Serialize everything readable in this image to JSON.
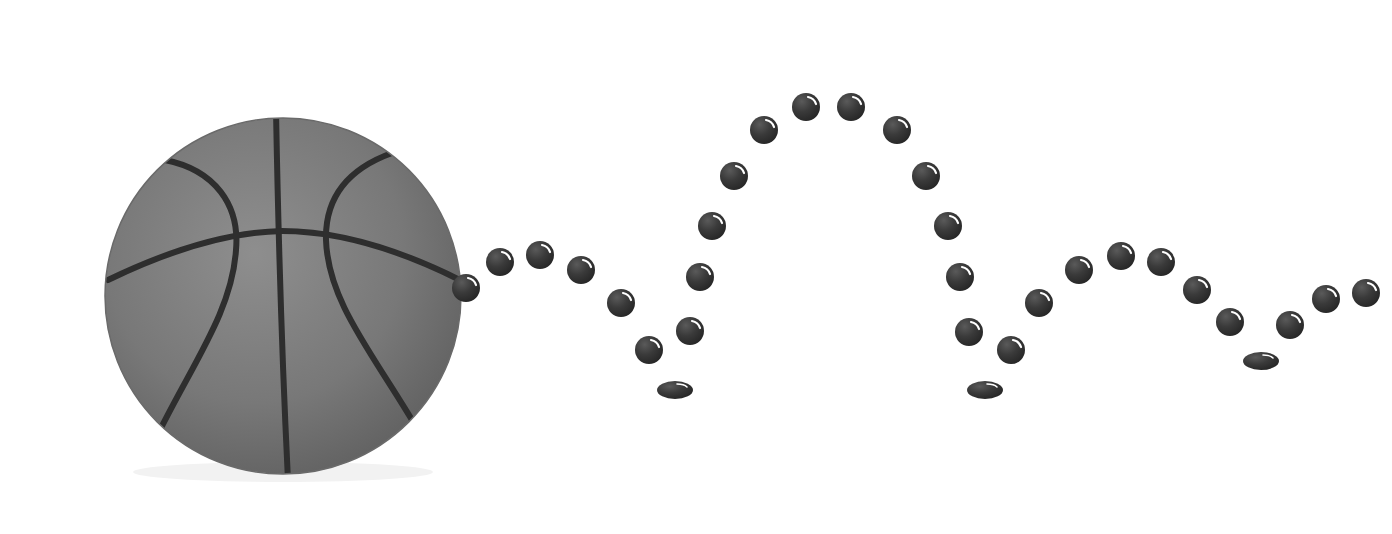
{
  "scene": {
    "title": "Bouncing basketball trajectory",
    "background": "#ffffff",
    "ball": {
      "label": "basketball",
      "center": [
        283,
        296
      ],
      "radius": 180,
      "fill": "#7a7a7a",
      "seam_color": "#2e2e2e"
    },
    "trail": {
      "label": "bounce trajectory dots",
      "dot_color": "#3a3a3a",
      "dot_radius": 14,
      "dots": [
        [
          466,
          288
        ],
        [
          500,
          262
        ],
        [
          540,
          255
        ],
        [
          581,
          270
        ],
        [
          621,
          303
        ],
        [
          649,
          350
        ],
        [
          690,
          331
        ],
        [
          700,
          277
        ],
        [
          712,
          226
        ],
        [
          734,
          176
        ],
        [
          764,
          130
        ],
        [
          806,
          107
        ],
        [
          851,
          107
        ],
        [
          897,
          130
        ],
        [
          926,
          176
        ],
        [
          948,
          226
        ],
        [
          960,
          277
        ],
        [
          969,
          332
        ],
        [
          1011,
          350
        ],
        [
          1039,
          303
        ],
        [
          1079,
          270
        ],
        [
          1121,
          256
        ],
        [
          1161,
          262
        ],
        [
          1197,
          290
        ],
        [
          1230,
          322
        ],
        [
          1290,
          325
        ],
        [
          1326,
          299
        ],
        [
          1366,
          293
        ]
      ],
      "bounces": [
        [
          675,
          390
        ],
        [
          985,
          390
        ],
        [
          1261,
          361
        ]
      ]
    }
  }
}
